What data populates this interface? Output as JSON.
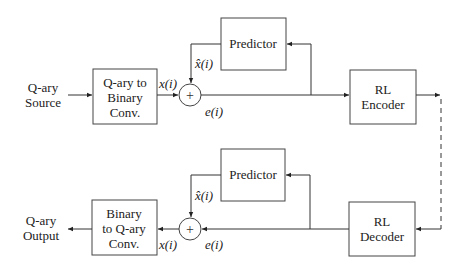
{
  "encoder": {
    "source_label_line1": "Q-ary",
    "source_label_line2": "Source",
    "converter_line1": "Q-ary to",
    "converter_line2": "Binary",
    "converter_line3": "Conv.",
    "predictor_label": "Predictor",
    "rl_line1": "RL",
    "rl_line2": "Encoder",
    "signal_x": "x(i)",
    "signal_xhat": "x̂(i)",
    "signal_e": "e(i)",
    "sum_symbol": "+"
  },
  "decoder": {
    "output_label_line1": "Q-ary",
    "output_label_line2": "Output",
    "converter_line1": "Binary",
    "converter_line2": "to Q-ary",
    "converter_line3": "Conv.",
    "predictor_label": "Predictor",
    "rl_line1": "RL",
    "rl_line2": "Decoder",
    "signal_x": "x(i)",
    "signal_xhat": "x̂(i)",
    "signal_e": "e(i)",
    "sum_symbol": "+"
  }
}
